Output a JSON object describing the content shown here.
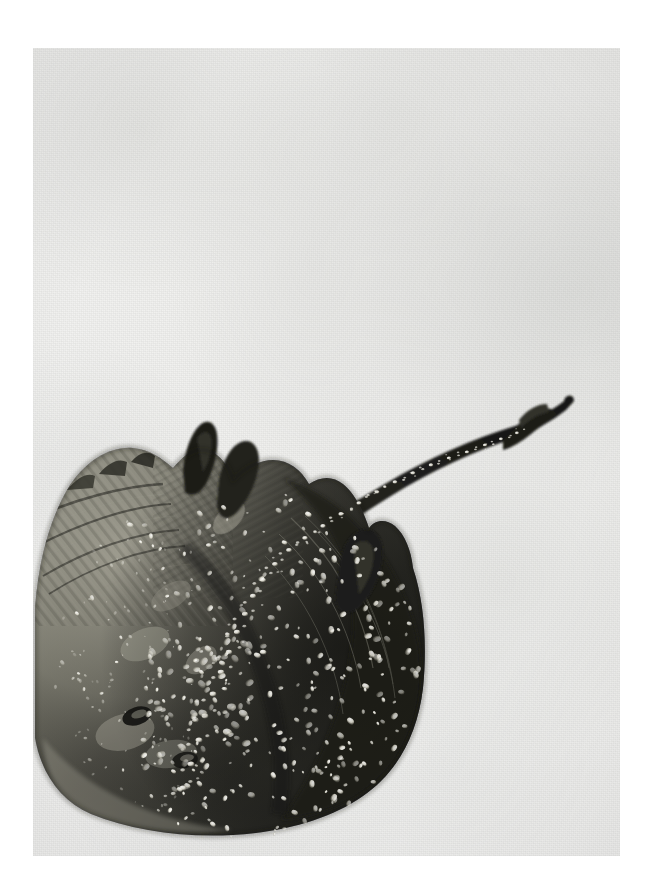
{
  "image": {
    "domain": "natural-image",
    "subject": "thornback ray / skate specimen photographed from above",
    "alt_text": "A dark thornback ray specimen lying on a pale grey textured surface, its broad diamond-shaped disc at lower left and a long thorn-studded tail curving up to the right.",
    "orientation": "portrait",
    "canvas": {
      "width": 652,
      "height": 896
    },
    "plate": {
      "left": 33,
      "top": 48,
      "width": 587,
      "height": 808
    },
    "palette": {
      "paper_white": "#ffffff",
      "background_light": "#f4f4f3",
      "background_mid": "#e8e9e6",
      "background_shade": "#d6d7d4",
      "body_darkest": "#1b1b1a",
      "body_dark": "#35352f",
      "body_mid": "#53524a",
      "body_light": "#85847a",
      "body_highlight": "#b9b7ab",
      "tubercle_white": "#f0efe6",
      "shadow": "#6a6b68"
    },
    "subject_features": [
      {
        "name": "pectoral-disc",
        "description": "broad rhomboid wing disc, lower-left of frame"
      },
      {
        "name": "left-wing-edge",
        "description": "crenulated anterior margin running up-left"
      },
      {
        "name": "right-wing-trailing-edge",
        "description": "smooth rounded posterior curve to the right"
      },
      {
        "name": "pelvic-fins",
        "description": "two lobed fins projecting at the rear of the disc"
      },
      {
        "name": "dorsal-horn",
        "description": "dark pointed projection near the top of the disc"
      },
      {
        "name": "tail",
        "description": "long tapering tail arcing to the upper right, ending in a small forked tip"
      },
      {
        "name": "thorn-row",
        "description": "median row of pale bucklers and thorns from mid-disc along the tail"
      },
      {
        "name": "denticle-field",
        "description": "scattered bright white tubercles across the right half of the disc"
      }
    ],
    "composition": {
      "disc_center": {
        "x": 200,
        "y": 620
      },
      "disc_width": 360,
      "disc_height": 330,
      "tail_tip": {
        "x": 535,
        "y": 352
      },
      "tail_base": {
        "x": 245,
        "y": 500
      },
      "light_direction": "upper left, soft diffuse"
    }
  }
}
